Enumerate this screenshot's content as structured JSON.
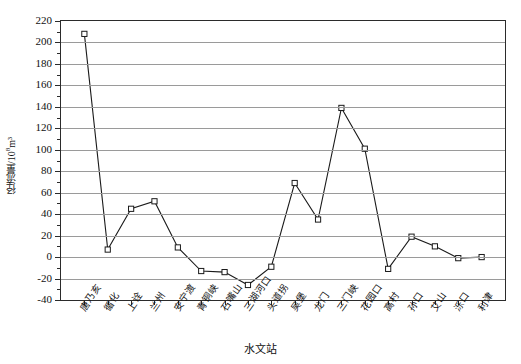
{
  "chart_data": {
    "type": "line",
    "title": "",
    "xlabel": "水文站",
    "ylabel": "径流量/10⁸m³",
    "ylabel_main": "径流量/10",
    "ylabel_exp": "8",
    "ylabel_unit": "m³",
    "ylim": [
      -40,
      220
    ],
    "ytick_step": 20,
    "yticks": [
      -40,
      -20,
      0,
      20,
      40,
      60,
      80,
      100,
      120,
      140,
      160,
      180,
      200,
      220
    ],
    "ytick_labels": [
      "-40",
      "-20",
      "0",
      "20",
      "40",
      "60",
      "80",
      "100",
      "120",
      "140",
      "160",
      "180",
      "200",
      "220"
    ],
    "grid": true,
    "grid_axis": "y",
    "legend": "none",
    "marker": "open-square",
    "line_color": "#1a1a1a",
    "marker_fill": "#ffffff",
    "categories": [
      "唐乃亥",
      "循化",
      "上诠",
      "兰州",
      "安宁渡",
      "青铜峡",
      "石嘴山",
      "三湖河口",
      "头道拐",
      "吴堡",
      "龙门",
      "三门峡",
      "花园口",
      "高村",
      "孙口",
      "艾山",
      "泺口",
      "利津"
    ],
    "values": [
      208,
      7,
      45,
      52,
      9,
      -13,
      -14,
      -26,
      -9,
      69,
      35,
      139,
      101,
      -11,
      19,
      10,
      -1,
      0
    ],
    "series": [
      {
        "name": "径流量",
        "values": [
          208,
          7,
          45,
          52,
          9,
          -13,
          -14,
          -26,
          -9,
          69,
          35,
          139,
          101,
          -11,
          19,
          10,
          -1,
          0
        ]
      }
    ]
  }
}
